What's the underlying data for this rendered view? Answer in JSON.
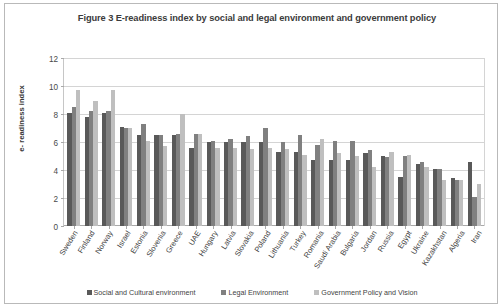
{
  "chart_data": {
    "type": "bar",
    "title": "Figure 3 E-readiness index by social and legal environment and government policy",
    "xlabel": "",
    "ylabel": "e- readiness index",
    "ylim": [
      0,
      12
    ],
    "yticks": [
      0,
      2,
      4,
      6,
      8,
      10,
      12
    ],
    "grid": true,
    "legend_position": "bottom",
    "categories": [
      "Sweden",
      "Finland",
      "Norway",
      "Israel",
      "Estonia",
      "Slovenia",
      "Greece",
      "UAE",
      "Hungary",
      "Latvia",
      "Slovakia",
      "Poland",
      "Lithuania",
      "Turkey",
      "Romania",
      "Saudi Arabia",
      "Bulgaria",
      "Jordan",
      "Russia",
      "Egypt",
      "Ukraine",
      "Kazakhstan",
      "Algeria",
      "Iran"
    ],
    "series": [
      {
        "name": "Social and Cultural environment",
        "color": "#595959",
        "values": [
          8.1,
          7.8,
          8.1,
          7.1,
          6.5,
          6.5,
          6.5,
          5.6,
          6.0,
          6.0,
          6.0,
          6.0,
          5.3,
          5.3,
          4.7,
          4.7,
          4.7,
          5.2,
          5.0,
          3.5,
          4.4,
          4.1,
          3.4,
          4.6
        ],
        "unit": ""
      },
      {
        "name": "Legal Environment",
        "color": "#808080",
        "values": [
          8.5,
          8.2,
          8.2,
          7.0,
          7.3,
          6.5,
          6.6,
          6.6,
          6.1,
          6.2,
          6.4,
          7.0,
          6.0,
          6.5,
          5.8,
          6.1,
          6.1,
          5.4,
          4.9,
          5.0,
          4.6,
          4.1,
          3.3,
          2.1
        ],
        "unit": ""
      },
      {
        "name": "Government Policy  and Vision",
        "color": "#bfbfbf",
        "values": [
          9.7,
          8.9,
          9.7,
          7.0,
          6.1,
          5.7,
          8.0,
          6.6,
          5.6,
          5.6,
          5.5,
          5.6,
          5.5,
          5.1,
          6.2,
          5.2,
          5.0,
          4.2,
          5.3,
          5.1,
          4.2,
          3.3,
          3.3,
          3.0
        ],
        "unit": ""
      }
    ]
  },
  "legend": {
    "items": [
      {
        "label": "Social and Cultural environment"
      },
      {
        "label": "Legal Environment"
      },
      {
        "label": "Government Policy  and Vision"
      }
    ]
  }
}
